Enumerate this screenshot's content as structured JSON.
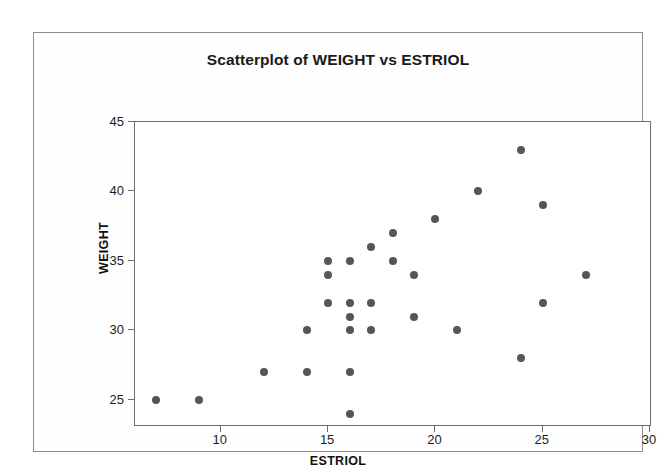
{
  "chart_data": {
    "type": "scatter",
    "title": "Scatterplot of WEIGHT vs ESTRIOL",
    "xlabel": "ESTRIOL",
    "ylabel": "WEIGHT",
    "xlim": [
      6,
      30
    ],
    "ylim": [
      23.2,
      45
    ],
    "grid": false,
    "legend": false,
    "marker_color": "#555659",
    "xticks": [
      10,
      15,
      20,
      25,
      30
    ],
    "yticks": [
      25,
      30,
      35,
      40,
      45
    ],
    "xtick_labels": [
      "10",
      "15",
      "20",
      "25",
      "30"
    ],
    "ytick_labels": [
      "25",
      "30",
      "35",
      "40",
      "45"
    ],
    "series": [
      {
        "name": "WEIGHT vs ESTRIOL",
        "points": [
          [
            7,
            25
          ],
          [
            9,
            25
          ],
          [
            12,
            27
          ],
          [
            14,
            27
          ],
          [
            14,
            30
          ],
          [
            15,
            35
          ],
          [
            15,
            34
          ],
          [
            15,
            32
          ],
          [
            16,
            35
          ],
          [
            16,
            32
          ],
          [
            16,
            31
          ],
          [
            16,
            30
          ],
          [
            16,
            27
          ],
          [
            16,
            24
          ],
          [
            17,
            36
          ],
          [
            17,
            32
          ],
          [
            17,
            30
          ],
          [
            18,
            37
          ],
          [
            18,
            35
          ],
          [
            19,
            34
          ],
          [
            19,
            31
          ],
          [
            20,
            38
          ],
          [
            21,
            30
          ],
          [
            22,
            40
          ],
          [
            24,
            43
          ],
          [
            24,
            28
          ],
          [
            25,
            39
          ],
          [
            25,
            32
          ],
          [
            27,
            34
          ]
        ]
      }
    ]
  },
  "frame": {
    "border_color": "#8d8d8d"
  }
}
